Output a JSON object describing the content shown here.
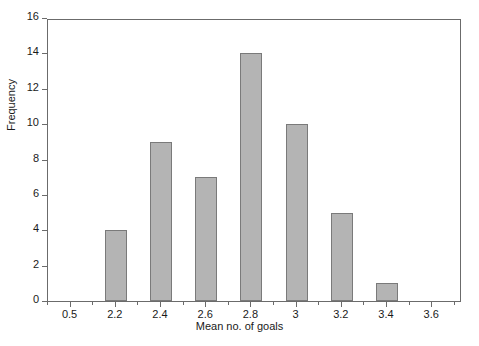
{
  "chart_data": {
    "type": "bar",
    "title": "",
    "subtitle": "",
    "xlabel": "Mean no. of goals",
    "ylabel": "Frequency",
    "categories": [
      "2.2",
      "2.4",
      "2.6",
      "2.8",
      "3",
      "3.2",
      "3.4"
    ],
    "values": [
      4,
      9,
      7,
      14,
      10,
      5,
      1
    ],
    "x_tick_labels": [
      "0.5",
      "2.2",
      "2.4",
      "2.6",
      "2.8",
      "3",
      "3.2",
      "3.4",
      "3.6"
    ],
    "y_tick_labels": [
      "0",
      "2",
      "4",
      "6",
      "8",
      "10",
      "12",
      "14",
      "16"
    ],
    "ylim": [
      0,
      16
    ],
    "y_tick_step": 2,
    "grid": false,
    "legend": null,
    "bar_fill_color": "#b4b4b4",
    "bar_edge_color": "#7a7a7a",
    "axis_color": "#6b6b6b",
    "text_color": "#1a1a1a",
    "background_color": "#ffffff",
    "bars": [
      {
        "label": "2.2",
        "value": 4
      },
      {
        "label": "2.4",
        "value": 9
      },
      {
        "label": "2.6",
        "value": 7
      },
      {
        "label": "2.8",
        "value": 14
      },
      {
        "label": "3",
        "value": 10
      },
      {
        "label": "3.2",
        "value": 5
      },
      {
        "label": "3.4",
        "value": 1
      }
    ],
    "annotations": []
  }
}
